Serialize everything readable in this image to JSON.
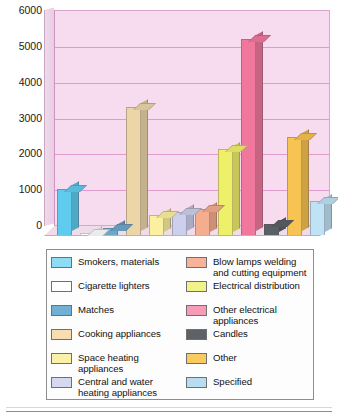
{
  "chart_data": {
    "type": "bar",
    "title": "",
    "xlabel": "",
    "ylabel": "",
    "ylim": [
      0,
      6000
    ],
    "ytick_labels": [
      "6000",
      "5000",
      "4000",
      "3000",
      "2000",
      "1000",
      "0"
    ],
    "ytick_values": [
      6000,
      5000,
      4000,
      3000,
      2000,
      1000,
      0
    ],
    "grid": true,
    "legend_position": "bottom",
    "categories": [
      "Smokers, materials",
      "Cigarette lighters",
      "Matches",
      "Cooking appliances",
      "Space heating appliances",
      "Central and water heating appliances",
      "Blow lamps welding and cutting equipment",
      "Electrical distribution",
      "Other electrical appliances",
      "Candles",
      "Other",
      "Specified"
    ],
    "values": [
      1300,
      50,
      200,
      3600,
      550,
      650,
      720,
      2400,
      5500,
      300,
      2750,
      950
    ],
    "colors": [
      "#5fcbef",
      "#ffffff",
      "#6ba8cc",
      "#ecd6a8",
      "#fbf0a0",
      "#ccd0ec",
      "#f4ad8e",
      "#eff06a",
      "#f0789c",
      "#5a6066",
      "#f7c352",
      "#bfe2f4"
    ]
  },
  "legend": {
    "left_column": [
      {
        "label": "Smokers, materials",
        "color": "#8ddcf4"
      },
      {
        "label": "Cigarette lighters",
        "color": "#ffffff"
      },
      {
        "label": "Matches",
        "color": "#6fb0d3"
      },
      {
        "label": "Cooking appliances",
        "color": "#f7ddb0"
      },
      {
        "label": "Space heating appliances",
        "color": "#fbf0a8"
      },
      {
        "label": "Central and water heating appliances",
        "color": "#d5d8ee"
      }
    ],
    "right_column": [
      {
        "label": "Blow lamps welding and cutting equipment",
        "color": "#f6b39a"
      },
      {
        "label": "Electrical distribution",
        "color": "#f2f28a"
      },
      {
        "label": "Other electrical appliances",
        "color": "#f79cb7"
      },
      {
        "label": "Candles",
        "color": "#5c6268"
      },
      {
        "label": "Other",
        "color": "#f9ca62"
      },
      {
        "label": "Specified",
        "color": "#b8ddf0"
      }
    ]
  },
  "style": {
    "plot_background": "#f6dcee",
    "gridline_color": "#d98fc6",
    "plot_border_color": "#cf92c2",
    "legend_border_color": "#8d8d8d"
  }
}
